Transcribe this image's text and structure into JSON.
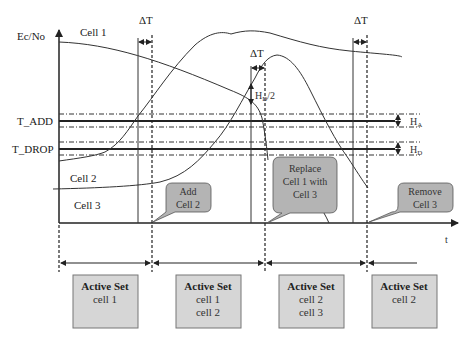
{
  "diagram": {
    "axes": {
      "y_label": "Ec/No",
      "x_label": "t"
    },
    "thresholds": {
      "t_add": "T_ADD",
      "t_drop": "T_DROP",
      "h_add": "H",
      "h_add_sub": "A",
      "h_drop": "H",
      "h_drop_sub": "D",
      "half_hyst": "H",
      "half_hyst_sub": "D",
      "half_hyst_suffix": "/2"
    },
    "curves": [
      {
        "name": "Cell 1",
        "label": "Cell 1"
      },
      {
        "name": "Cell 2",
        "label": "Cell 2"
      },
      {
        "name": "Cell 3",
        "label": "Cell 3"
      }
    ],
    "delta_t": [
      "ΔT",
      "ΔT",
      "ΔT"
    ],
    "events": [
      {
        "label_line1": "Add",
        "label_line2": "Cell 2",
        "label_line3": ""
      },
      {
        "label_line1": "Replace",
        "label_line2": "Cell 1 with",
        "label_line3": "Cell 3"
      },
      {
        "label_line1": "Remove",
        "label_line2": "Cell 3",
        "label_line3": ""
      }
    ],
    "active_sets": [
      {
        "title": "Active Set",
        "cells": [
          "cell 1",
          ""
        ]
      },
      {
        "title": "Active Set",
        "cells": [
          "cell 1",
          "cell 2"
        ]
      },
      {
        "title": "Active Set",
        "cells": [
          "cell 2",
          "cell 3"
        ]
      },
      {
        "title": "Active Set",
        "cells": [
          "cell 2",
          ""
        ]
      }
    ],
    "colors": {
      "line": "#222222",
      "callout_fill": "#b4b4b4",
      "box_fill": "#d6d6d6",
      "box_border": "#777777"
    }
  }
}
